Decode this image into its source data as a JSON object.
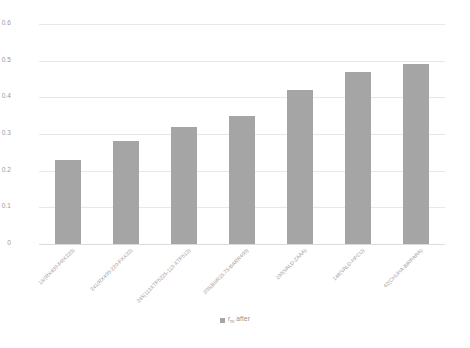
{
  "chart_data": {
    "type": "bar",
    "title": "",
    "subtitle": "",
    "xlabel": "",
    "ylabel": "",
    "ylim": [
      0,
      0.6
    ],
    "ytick_values": [
      0,
      0.1,
      0.2,
      0.3,
      0.4,
      0.5,
      0.6
    ],
    "ytick_labels": [
      "0",
      "0.1",
      "0.2",
      "0.3",
      "0.4",
      "0.5",
      "0.6"
    ],
    "grid": true,
    "grid_axis": "y",
    "legend_position": "bottom-center",
    "bar_color": "#a5a5a5",
    "gridline_color": "#e8e8e8",
    "tick_label_color": "#9a9a9a",
    "categories": [
      "16/(RX400-PRX220)",
      "241(RX400-220-PXX33)",
      "245(113XTP5225-113-XTP513)",
      "205(BSR15.75-BARR400)",
      "100(VALD-ZAAA)",
      "148(VALD-HPCU)",
      "42(CHUHA-BIRPARA)"
    ],
    "series": [
      {
        "name": "r_m after",
        "values": [
          0.23,
          0.28,
          0.32,
          0.35,
          0.42,
          0.47,
          0.49
        ]
      }
    ],
    "legend": [
      {
        "label_prefix": "r",
        "label_subscript": "m",
        "label_suffix": " after",
        "color": "#a5a5a5"
      }
    ]
  }
}
